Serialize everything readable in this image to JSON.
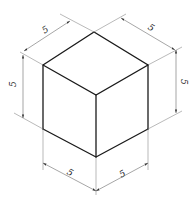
{
  "diagram": {
    "stroke_color": "#1a1a1a",
    "dimension_color": "#6a6a6a",
    "dimensions": {
      "top_left": "5",
      "top_right": "5",
      "left_vertical": "5",
      "right_vertical": "5",
      "bottom_left": "5",
      "bottom_right": "5"
    }
  }
}
